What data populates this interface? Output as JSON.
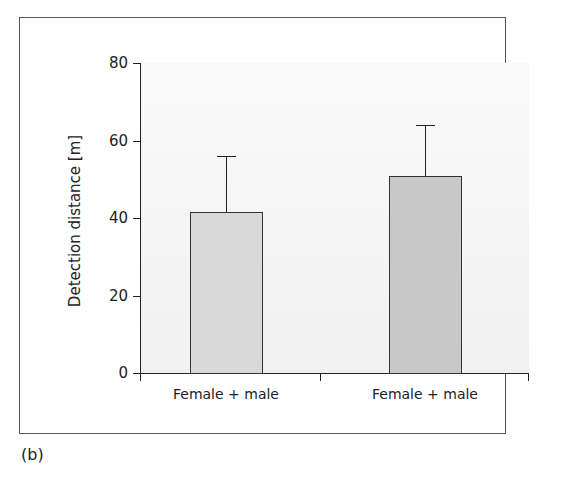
{
  "panel_label": "(b)",
  "chart_data": {
    "type": "bar",
    "title": "",
    "xlabel": "",
    "ylabel": "Detection distance [m]",
    "ylim": [
      0,
      80
    ],
    "yticks": [
      0,
      20,
      40,
      60,
      80
    ],
    "ytick_labels": [
      "0",
      "20",
      "40",
      "60",
      "80"
    ],
    "categories": [
      "Female + male",
      "Female + male"
    ],
    "values": [
      41.5,
      50.8
    ],
    "error_upper": [
      56,
      64
    ],
    "bar_colors": [
      "#d9d9d9",
      "#c8c8c8"
    ],
    "grid": false,
    "legend": null
  }
}
